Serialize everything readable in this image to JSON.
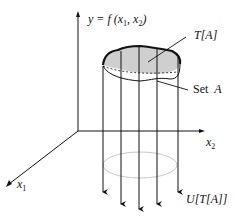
{
  "figure": {
    "function_label": {
      "prefix": "y = f (x",
      "sub1": "1",
      "mid": ",  x",
      "sub2": "2",
      "suffix": ")"
    },
    "image_set_label": "T[A]",
    "set_label": {
      "word": "Set",
      "symbol": "A"
    },
    "axis_x2": {
      "var": "x",
      "sub": "2"
    },
    "axis_x1": {
      "var": "x",
      "sub": "1"
    },
    "preimage_label": "U[T[A]]",
    "colors": {
      "ink": "#111111",
      "surface_fill": "#cfcfcf",
      "projection_ellipse": "#c8c8c8"
    }
  }
}
